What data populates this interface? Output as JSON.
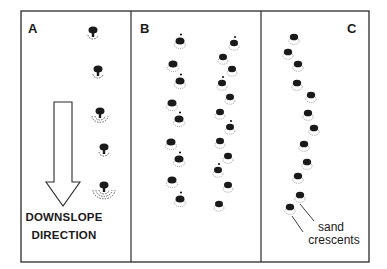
{
  "figure": {
    "panels": [
      {
        "id": "A",
        "label": "A"
      },
      {
        "id": "B",
        "label": "B"
      },
      {
        "id": "C",
        "label": "C"
      }
    ],
    "arrow_caption": {
      "line1": "DOWNSLOPE",
      "line2": "DIRECTION"
    },
    "annotation": {
      "line1": "sand",
      "line2": "crescents"
    },
    "colors": {
      "ink": "#1a1a1a",
      "frame": "#2a2a2a",
      "background": "#ffffff"
    },
    "features": {
      "A": [
        [
          93,
          33
        ],
        [
          98,
          72
        ],
        [
          100,
          114
        ],
        [
          104,
          150
        ],
        [
          104,
          188
        ]
      ],
      "B_left": [
        [
          180,
          42
        ],
        [
          173,
          65
        ],
        [
          180,
          82
        ],
        [
          172,
          104
        ],
        [
          179,
          120
        ],
        [
          171,
          143
        ],
        [
          179,
          160
        ],
        [
          172,
          181
        ],
        [
          180,
          200
        ]
      ],
      "B_right": [
        [
          234,
          44
        ],
        [
          223,
          58
        ],
        [
          232,
          70
        ],
        [
          222,
          84
        ],
        [
          230,
          98
        ],
        [
          220,
          113
        ],
        [
          230,
          128
        ],
        [
          220,
          142
        ],
        [
          228,
          157
        ],
        [
          218,
          171
        ],
        [
          228,
          186
        ],
        [
          219,
          205
        ]
      ],
      "C": [
        [
          294,
          38
        ],
        [
          288,
          53
        ],
        [
          298,
          65
        ],
        [
          297,
          84
        ],
        [
          311,
          96
        ],
        [
          308,
          114
        ],
        [
          314,
          129
        ],
        [
          304,
          145
        ],
        [
          307,
          163
        ],
        [
          298,
          177
        ],
        [
          300,
          196
        ],
        [
          290,
          208
        ]
      ]
    }
  }
}
